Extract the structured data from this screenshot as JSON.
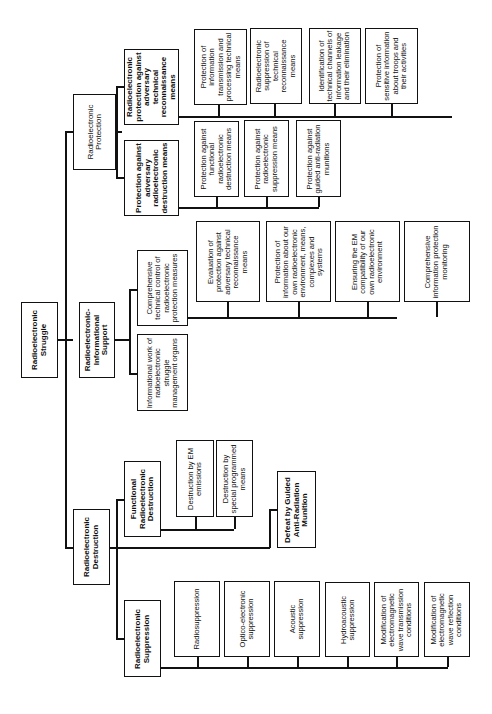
{
  "diagram": {
    "root": {
      "label": "Radioelectronic Struggle"
    },
    "branches": {
      "protection": {
        "label": "Radioelectronic Protection",
        "children": {
          "recon": {
            "label": "Radioelectronic protection against adversary technical reconnaissance means",
            "items": [
              "Protection of information transmission and processing technical means",
              "Radioelectronic suppression of technical reconnaissance means",
              "Identification of technical channels of information leakage and their elimination",
              "Protection of sensitive information about troops and their activities"
            ]
          },
          "destruction": {
            "label": "Protection against adversary radioelectronic destruction means",
            "items": [
              "Protection against functional radioelectronic destruction means",
              "Protection against radioelectronic suppression means",
              "Protection against guided anti-radiation munitions"
            ]
          }
        }
      },
      "support": {
        "label": "Radioelectronic-Informational Support",
        "children": {
          "control": {
            "label": "Comprehensive technical control of radioelectronic protection measures",
            "items": [
              "Evaluation of protection against adversary technical reconnaissance means",
              "Protection of information about our own radioelectronic environment, means, complexes and systems",
              "Ensuring the EM compatibility of our own radioelectronic environment",
              "Comprehensive information protection monitoring"
            ]
          },
          "work": {
            "label": "Informational work of radioelectronic struggle management organs"
          }
        }
      },
      "destruction": {
        "label": "Radioelectronic Destruction",
        "children": {
          "functional": {
            "label": "Functional Radioelectronic Destruction",
            "items": [
              "Destruction by EM emissions",
              "Destruction by special programmed means"
            ]
          },
          "guided": {
            "label": "Defeat by Guided Anti-Radiation Munition"
          },
          "suppression": {
            "label": "Radioelectronic Suppression",
            "items": [
              "Radiosuppression",
              "Optico-electronic suppression",
              "Acoustic suppression",
              "Hydroacoustic suppression",
              "Modification of electromagnetic wave transmission conditions",
              "Modification of electromagnetic wave reflection conditions"
            ]
          }
        }
      }
    }
  }
}
